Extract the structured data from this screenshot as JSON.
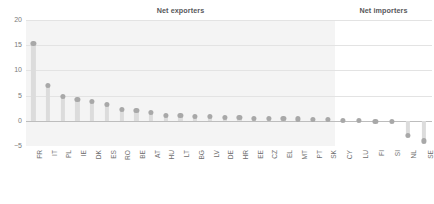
{
  "panels": {
    "exporters_title": "Net exporters",
    "importers_title": "Net importers"
  },
  "axis": {
    "y_ticks": [
      "20",
      "15",
      "10",
      "5",
      "0",
      "−5"
    ],
    "y_tick_values": [
      20,
      15,
      10,
      5,
      0,
      -5
    ]
  },
  "colors": {
    "panel_background": "#f4f4f4",
    "marker": "#a8a8a8",
    "stem": "#dcdcdc",
    "gridline": "#e3e3e3",
    "zeroline": "#bdbdbd",
    "text": "#6e6e6e",
    "title_text": "#58585a"
  },
  "chart_data": {
    "type": "bar",
    "title": "",
    "subtitle": "",
    "xlabel": "",
    "ylabel": "",
    "ylim": [
      -5,
      20
    ],
    "grid": true,
    "legend_position": "none",
    "panels": [
      "Net exporters",
      "Net importers"
    ],
    "categories": [
      "FR",
      "IT",
      "PL",
      "IE",
      "DK",
      "ES",
      "RO",
      "BE",
      "AT",
      "HU",
      "LT",
      "BG",
      "LV",
      "DE",
      "HR",
      "EE",
      "CZ",
      "EL",
      "MT",
      "PT",
      "SK",
      "CY",
      "LU",
      "FI",
      "SI",
      "NL",
      "SE"
    ],
    "values": [
      15.4,
      7.0,
      4.9,
      4.3,
      3.9,
      3.2,
      2.3,
      2.0,
      1.6,
      1.0,
      1.0,
      0.9,
      0.8,
      0.7,
      0.6,
      0.5,
      0.45,
      0.4,
      0.35,
      0.3,
      0.25,
      0.1,
      0.05,
      -0.1,
      -0.2,
      -2.9,
      -4.0
    ],
    "panel_of": [
      "Net exporters",
      "Net exporters",
      "Net exporters",
      "Net exporters",
      "Net exporters",
      "Net exporters",
      "Net exporters",
      "Net exporters",
      "Net exporters",
      "Net exporters",
      "Net exporters",
      "Net exporters",
      "Net exporters",
      "Net exporters",
      "Net exporters",
      "Net exporters",
      "Net exporters",
      "Net exporters",
      "Net exporters",
      "Net exporters",
      "Net exporters",
      "Net importers",
      "Net importers",
      "Net importers",
      "Net importers",
      "Net importers",
      "Net importers"
    ]
  }
}
